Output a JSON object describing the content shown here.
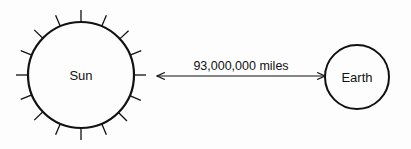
{
  "diagram": {
    "sun": {
      "label": "Sun",
      "cx": 81,
      "cy": 75,
      "r": 53,
      "ray_inner": 53,
      "ray_outer": 65,
      "ray_angles": [
        0,
        23,
        47,
        68,
        90,
        113,
        135,
        157,
        180,
        203,
        226,
        248,
        270,
        292,
        314,
        337
      ]
    },
    "earth": {
      "label": "Earth",
      "cx": 357,
      "cy": 77,
      "r": 32
    },
    "arrow": {
      "label": "93,000,000 miles",
      "x1": 157,
      "x2": 325,
      "y": 76
    },
    "colors": {
      "stroke": "#111111",
      "text": "#111111",
      "background": "#fdfdfd"
    }
  }
}
